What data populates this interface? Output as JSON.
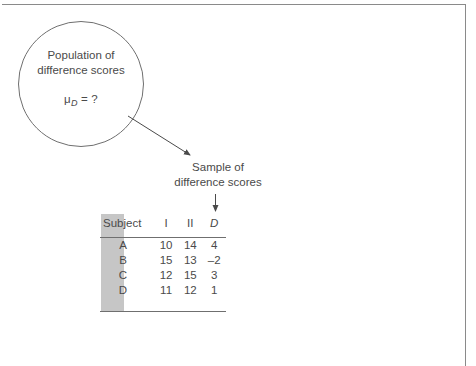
{
  "figure": {
    "population": {
      "line1": "Population of",
      "line2": "difference scores",
      "mu_symbol": "μ",
      "mu_subscript": "D",
      "mu_equals": " = ?"
    },
    "sample": {
      "line1": "Sample of",
      "line2": "difference scores"
    },
    "table": {
      "headers": {
        "subject": "Subject",
        "col1": "I",
        "col2": "II",
        "col3": "D"
      },
      "rows": [
        {
          "subject": "A",
          "i": "10",
          "ii": "14",
          "d": "4"
        },
        {
          "subject": "B",
          "i": "15",
          "ii": "13",
          "d": "–2"
        },
        {
          "subject": "C",
          "i": "12",
          "ii": "15",
          "d": "3"
        },
        {
          "subject": "D",
          "i": "11",
          "ii": "12",
          "d": "1"
        }
      ],
      "highlight_color": "#c6c6c6"
    },
    "colors": {
      "line": "#6f6f6f",
      "text": "#4a4a4a",
      "frame": "#8a8a8a",
      "background": "#ffffff"
    }
  }
}
